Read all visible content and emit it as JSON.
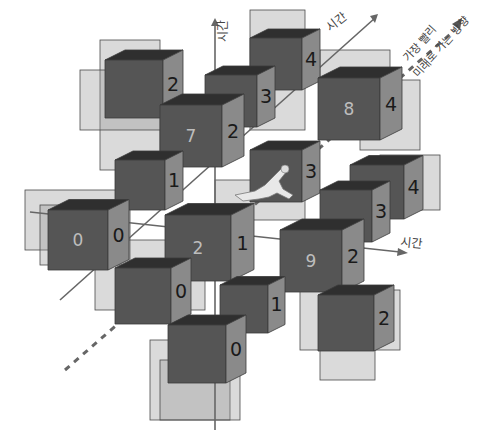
{
  "figure": {
    "colors": {
      "solid_front": "#555555",
      "solid_top": "#2f2f2f",
      "solid_side": "#8a8a8a",
      "ghost": "#969696",
      "axis": "#666666"
    }
  },
  "axes": {
    "vertical_label": "시간",
    "diagonal_label": "시간",
    "horizontal_label": "시간",
    "fastest_future_label_line1": "가장 빨리",
    "fastest_future_label_line2": "미래로 가는 방향"
  },
  "cubes": [
    {
      "id": "c-back-2",
      "x": 105,
      "y": 60,
      "size": 58,
      "front_number": "",
      "side_number": "2"
    },
    {
      "id": "c-back-4",
      "x": 250,
      "y": 38,
      "size": 52,
      "front_number": "",
      "side_number": "4"
    },
    {
      "id": "c-1-3",
      "x": 205,
      "y": 75,
      "size": 52,
      "front_number": "1",
      "side_number": "3"
    },
    {
      "id": "c-8",
      "x": 318,
      "y": 78,
      "size": 62,
      "front_number": "8",
      "side_number": "4"
    },
    {
      "id": "c-7",
      "x": 160,
      "y": 105,
      "size": 62,
      "front_number": "7",
      "side_number": "2"
    },
    {
      "id": "c-mid-1",
      "x": 115,
      "y": 160,
      "size": 50,
      "front_number": "",
      "side_number": "1"
    },
    {
      "id": "c-mid-3",
      "x": 250,
      "y": 150,
      "size": 52,
      "front_number": "",
      "side_number": "3"
    },
    {
      "id": "c-right-4-3",
      "x": 350,
      "y": 165,
      "size": 54,
      "front_number": "",
      "side_number": "4"
    },
    {
      "id": "c-right-3",
      "x": 320,
      "y": 190,
      "size": 52,
      "front_number": "",
      "side_number": "3"
    },
    {
      "id": "c-0",
      "x": 48,
      "y": 210,
      "size": 60,
      "front_number": "0",
      "side_number": "0"
    },
    {
      "id": "c-2-1",
      "x": 165,
      "y": 215,
      "size": 66,
      "front_number": "2",
      "side_number": "1"
    },
    {
      "id": "c-9-2",
      "x": 280,
      "y": 230,
      "size": 62,
      "front_number": "9",
      "side_number": "2"
    },
    {
      "id": "c-low-0",
      "x": 115,
      "y": 268,
      "size": 56,
      "front_number": "",
      "side_number": "0"
    },
    {
      "id": "c-low-1",
      "x": 220,
      "y": 285,
      "size": 48,
      "front_number": "",
      "side_number": "1"
    },
    {
      "id": "c-low-2",
      "x": 318,
      "y": 295,
      "size": 56,
      "front_number": "",
      "side_number": "2"
    },
    {
      "id": "c-bottom-0",
      "x": 168,
      "y": 325,
      "size": 58,
      "front_number": "",
      "side_number": "0"
    }
  ],
  "figure_runner": {
    "label": "running person",
    "x": 235,
    "y": 165
  }
}
